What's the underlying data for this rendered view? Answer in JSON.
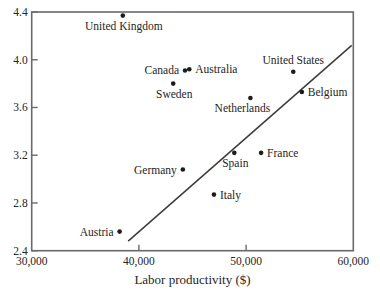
{
  "chart_data": {
    "type": "scatter",
    "title": "",
    "xlabel": "Labor productivity ($)",
    "ylabel": "",
    "xlim": [
      30000,
      60000
    ],
    "ylim": [
      2.4,
      4.4
    ],
    "grid": false,
    "x_ticks": [
      {
        "value": 30000,
        "label": "30,000",
        "mark": false
      },
      {
        "value": 40000,
        "label": "40,000",
        "mark": true
      },
      {
        "value": 50000,
        "label": "50,000",
        "mark": true
      },
      {
        "value": 60000,
        "label": "60,000",
        "mark": false
      }
    ],
    "y_ticks": [
      {
        "value": 2.4,
        "label": "2.4",
        "mark": true
      },
      {
        "value": 2.8,
        "label": "2.8",
        "mark": true
      },
      {
        "value": 3.2,
        "label": "3.2",
        "mark": true
      },
      {
        "value": 3.6,
        "label": "3.6",
        "mark": true
      },
      {
        "value": 4.0,
        "label": "4.0",
        "mark": true
      },
      {
        "value": 4.4,
        "label": "4.4",
        "mark": true
      }
    ],
    "points": [
      {
        "label": "United Kingdom",
        "x": 38500,
        "y": 4.37,
        "label_pos": "below"
      },
      {
        "label": "Canada",
        "x": 44300,
        "y": 3.91,
        "label_pos": "left"
      },
      {
        "label": "Australia",
        "x": 44700,
        "y": 3.92,
        "label_pos": "right"
      },
      {
        "label": "Sweden",
        "x": 43200,
        "y": 3.8,
        "label_pos": "below"
      },
      {
        "label": "United States",
        "x": 54400,
        "y": 3.9,
        "label_pos": "above"
      },
      {
        "label": "Belgium",
        "x": 55200,
        "y": 3.73,
        "label_pos": "right"
      },
      {
        "label": "Netherlands",
        "x": 50400,
        "y": 3.68,
        "label_pos": "below-left"
      },
      {
        "label": "Spain",
        "x": 48900,
        "y": 3.22,
        "label_pos": "below"
      },
      {
        "label": "France",
        "x": 51400,
        "y": 3.22,
        "label_pos": "right"
      },
      {
        "label": "Germany",
        "x": 44100,
        "y": 3.08,
        "label_pos": "left"
      },
      {
        "label": "Italy",
        "x": 47000,
        "y": 2.87,
        "label_pos": "right"
      },
      {
        "label": "Austria",
        "x": 38200,
        "y": 2.56,
        "label_pos": "left"
      }
    ],
    "trendline": {
      "x1": 39000,
      "y1": 2.48,
      "x2": 59850,
      "y2": 4.12
    },
    "legend": null,
    "colors": {
      "background": "#ffffff",
      "frame": "#6a6a6a",
      "tick": "#6a6a6a",
      "dot": "#1c1c1c",
      "trend": "#3c3c3c",
      "text": "#252525"
    }
  }
}
